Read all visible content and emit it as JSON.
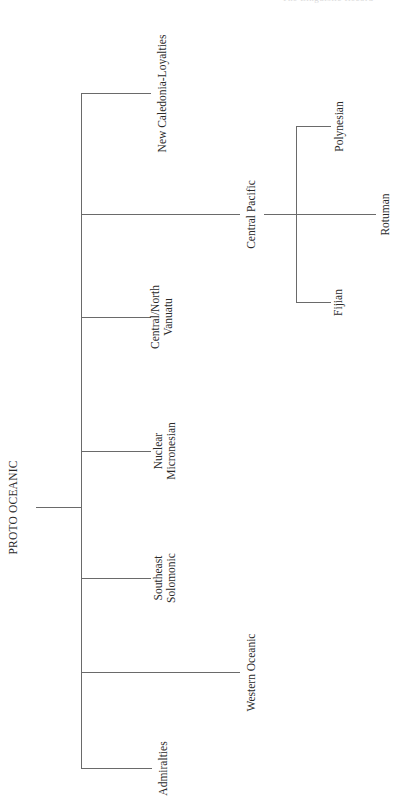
{
  "header": {
    "running_title": "The Linguistic Record"
  },
  "tree": {
    "root": "PROTO OCEANIC",
    "branches": [
      {
        "label": "New Caledonia-Loyalties"
      },
      {
        "label": "Central Pacific",
        "children": [
          {
            "label": "Polynesian"
          },
          {
            "label": "Rotuman"
          },
          {
            "label": "Fijian"
          }
        ]
      },
      {
        "label_line1": "Central/North",
        "label_line2": "Vanuatu"
      },
      {
        "label_line1": "Nuclear",
        "label_line2": "Micronesian"
      },
      {
        "label_line1": "Southeast",
        "label_line2": "Solomonic"
      },
      {
        "label": "Western Oceanic"
      },
      {
        "label": "Admiralties"
      }
    ]
  },
  "colors": {
    "line": "#6a6a6a",
    "text": "#2a2a2a",
    "background": "#ffffff"
  }
}
